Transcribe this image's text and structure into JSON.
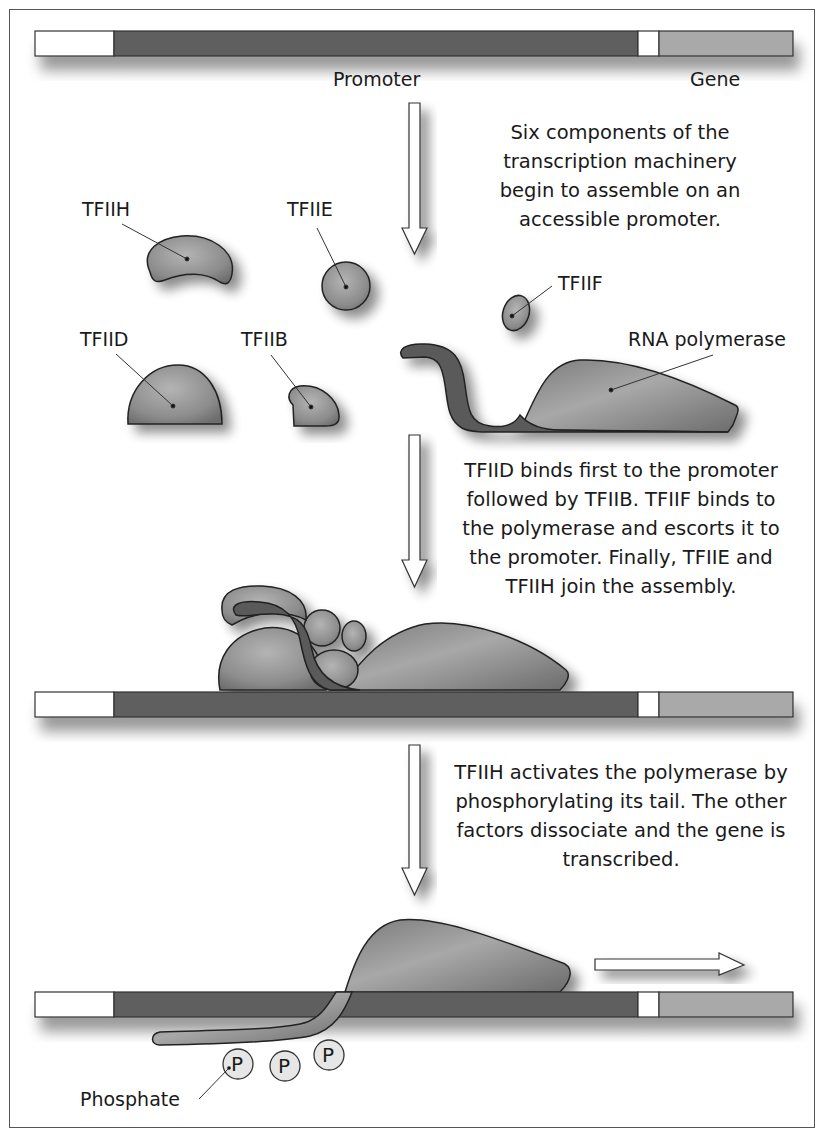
{
  "figure": {
    "dna_labels": {
      "promoter": "Promoter",
      "gene": "Gene"
    },
    "captions": {
      "step1": [
        "Six components of the",
        "transcription machinery",
        "begin to assemble on an",
        "accessible promoter."
      ],
      "step2": [
        "TFIID binds first to the promoter",
        "followed by TFIIB. TFIIF binds to",
        "the polymerase and escorts it to",
        "the promoter. Finally, TFIIE and",
        "TFIIH join the assembly."
      ],
      "step3": [
        "TFIIH activates the polymerase by",
        "phosphorylating its tail. The other",
        "factors dissociate and the gene is",
        "transcribed."
      ]
    },
    "components": {
      "tfiih": "TFIIH",
      "tfiie": "TFIIE",
      "tfiid": "TFIID",
      "tfiib": "TFIIB",
      "tfiif": "TFIIF",
      "rna_polymerase": "RNA polymerase"
    },
    "phosphate": {
      "label": "Phosphate",
      "symbol": "P"
    },
    "colors": {
      "dna_left": "#ffffff",
      "promoter": "#5e5e5e",
      "spacer": "#ffffff",
      "gene": "#a9a9a9",
      "protein": "#8a8a8a",
      "tail": "#5a5a5a",
      "outline": "#222222"
    }
  }
}
